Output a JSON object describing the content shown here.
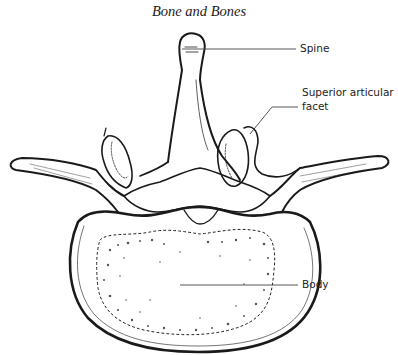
{
  "page": {
    "header": "Bone and Bones"
  },
  "figure": {
    "labels": [
      {
        "id": "spine",
        "text": "Spine"
      },
      {
        "id": "superior-articular-facet",
        "text": "Superior articular facet",
        "line1": "Superior articular",
        "line2": "facet"
      },
      {
        "id": "body",
        "text": "Body"
      }
    ]
  },
  "colors": {
    "ink": "#1a1a1a",
    "leader": "#444444",
    "paper": "#ffffff"
  }
}
